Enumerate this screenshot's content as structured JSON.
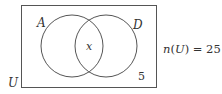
{
  "diagram": {
    "type": "venn",
    "universe_label": "U",
    "sets": [
      {
        "label": "A"
      },
      {
        "label": "D"
      }
    ],
    "regions": {
      "intersection": "x",
      "outside": "5"
    },
    "annotation": {
      "prefix": "n(",
      "set": "U",
      "suffix": ") = 25"
    },
    "colors": {
      "stroke": "#555555",
      "text": "#333333"
    }
  }
}
